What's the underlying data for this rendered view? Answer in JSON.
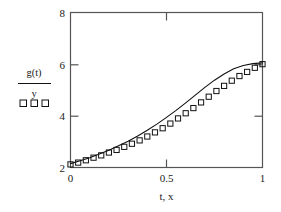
{
  "chart_data": {
    "type": "line",
    "title": "",
    "xlabel": "t, x",
    "ylabel": "g(t) / y",
    "xlim": [
      0,
      1
    ],
    "ylim": [
      2,
      8
    ],
    "xticks": [
      0,
      0.5,
      1
    ],
    "xticklabels": [
      "0",
      "0.5",
      "1"
    ],
    "yticks": [
      2,
      4,
      6,
      8
    ],
    "yticklabels": [
      "2",
      "4",
      "6",
      "8"
    ],
    "grid": false,
    "legend_position": "outside-left",
    "series": [
      {
        "name": "g(t)",
        "style": "solid-line",
        "marker": "none",
        "color": "#111111",
        "x": [
          0.0,
          0.05,
          0.1,
          0.15,
          0.2,
          0.25,
          0.3,
          0.35,
          0.4,
          0.45,
          0.5,
          0.55,
          0.6,
          0.65,
          0.7,
          0.75,
          0.8,
          0.85,
          0.9,
          0.95,
          1.0
        ],
        "y": [
          2.15,
          2.26,
          2.38,
          2.52,
          2.67,
          2.84,
          3.02,
          3.22,
          3.44,
          3.68,
          3.94,
          4.21,
          4.5,
          4.8,
          5.1,
          5.38,
          5.62,
          5.82,
          5.95,
          6.02,
          6.05
        ]
      },
      {
        "name": "y",
        "style": "markers",
        "marker": "open-square",
        "color": "#111111",
        "x": [
          0.0,
          0.04,
          0.08,
          0.12,
          0.16,
          0.2,
          0.24,
          0.28,
          0.32,
          0.36,
          0.4,
          0.44,
          0.48,
          0.52,
          0.56,
          0.6,
          0.64,
          0.68,
          0.72,
          0.76,
          0.8,
          0.84,
          0.88,
          0.92,
          0.96,
          1.0
        ],
        "y": [
          2.12,
          2.19,
          2.28,
          2.38,
          2.47,
          2.58,
          2.68,
          2.8,
          2.92,
          3.05,
          3.2,
          3.36,
          3.52,
          3.7,
          3.9,
          4.1,
          4.3,
          4.52,
          4.74,
          4.96,
          5.16,
          5.36,
          5.54,
          5.7,
          5.86,
          6.0
        ]
      }
    ]
  },
  "legend": {
    "numerator_label": "g(t)",
    "denominator_label": "y",
    "marker_sample": "□ □ □"
  },
  "axes": {
    "x_axis_title": "t, x",
    "y_tick_8": "8",
    "y_tick_6": "6",
    "y_tick_4": "4",
    "y_tick_2": "2",
    "x_tick_0": "0",
    "x_tick_05": "0.5",
    "x_tick_1": "1"
  },
  "colors": {
    "line": "#111111",
    "marker": "#111111",
    "frame": "#555555",
    "background": "#ffffff"
  }
}
